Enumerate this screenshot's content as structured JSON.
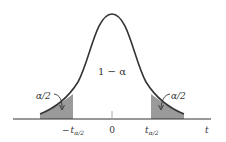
{
  "figure": {
    "colors": {
      "curve": "#333333",
      "shade": "#9a9a9a",
      "axis": "#333333",
      "tick": "#aaaaaa"
    },
    "labels": {
      "center_area": "1 − α",
      "left_tail": "α/2",
      "right_tail": "α/2",
      "axis_variable": "t",
      "zero_tick": "0",
      "left_crit_minus": "−",
      "left_crit_t": "t",
      "left_crit_sub": "α/2",
      "right_crit_t": "t",
      "right_crit_sub": "α/2"
    }
  }
}
